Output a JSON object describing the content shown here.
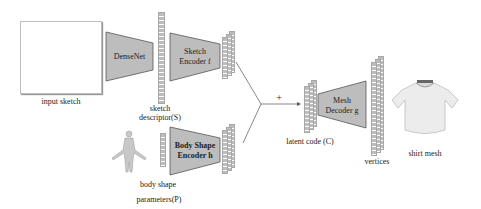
{
  "figure": {
    "input_sketch": {
      "label": "input sketch"
    },
    "densenet": {
      "label": "DenseNet"
    },
    "sketch_descriptor": {
      "label_line1": "sketch",
      "label_line2": "descriptor(S)"
    },
    "sketch_encoder": {
      "label_line1": "Sketch",
      "label_line2": "Encoder f"
    },
    "body_shape": {
      "label_line1": "body shape",
      "label_line2": "parameters(P)"
    },
    "body_shape_encoder": {
      "label_line1": "Body Shape",
      "label_line2": "Encoder h"
    },
    "combine_symbol": "+",
    "latent_code": {
      "label": "latent code (C)"
    },
    "mesh_decoder": {
      "label_line1": "Mesh",
      "label_line2": "Decoder g"
    },
    "vertices": {
      "label": "vertices"
    },
    "shirt_mesh": {
      "label": "shirt mesh"
    },
    "colors": {
      "block_fill": "#bdbdbd",
      "block_stroke": "#555555",
      "vector_fill": "#bcbcbc",
      "line": "#555555"
    }
  }
}
